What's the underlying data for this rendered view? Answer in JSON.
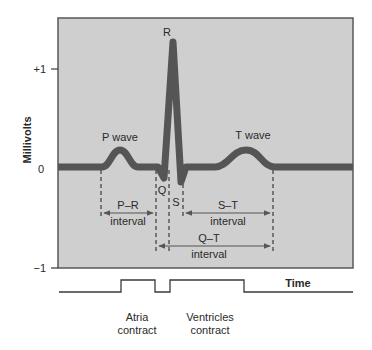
{
  "colors": {
    "panel_fill": "#cfcfcf",
    "panel_border": "#5a5a5a",
    "trace": "#555555",
    "text": "#2a2a2a",
    "lines": "#3a3a3a"
  },
  "axis": {
    "ylabel": "Millivolts",
    "ticks": [
      "+1",
      "0",
      "−1"
    ],
    "xlabel": "Time"
  },
  "waves": {
    "p": "P wave",
    "r": "R",
    "q": "Q",
    "s": "S",
    "t": "T wave"
  },
  "intervals": {
    "pr": {
      "name": "P–R",
      "sub": "interval"
    },
    "st": {
      "name": "S–T",
      "sub": "interval"
    },
    "qt": {
      "name": "Q–T",
      "sub": "interval"
    }
  },
  "events": {
    "atria": {
      "line1": "Atria",
      "line2": "contract"
    },
    "ventricles": {
      "line1": "Ventricles",
      "line2": "contract"
    }
  }
}
